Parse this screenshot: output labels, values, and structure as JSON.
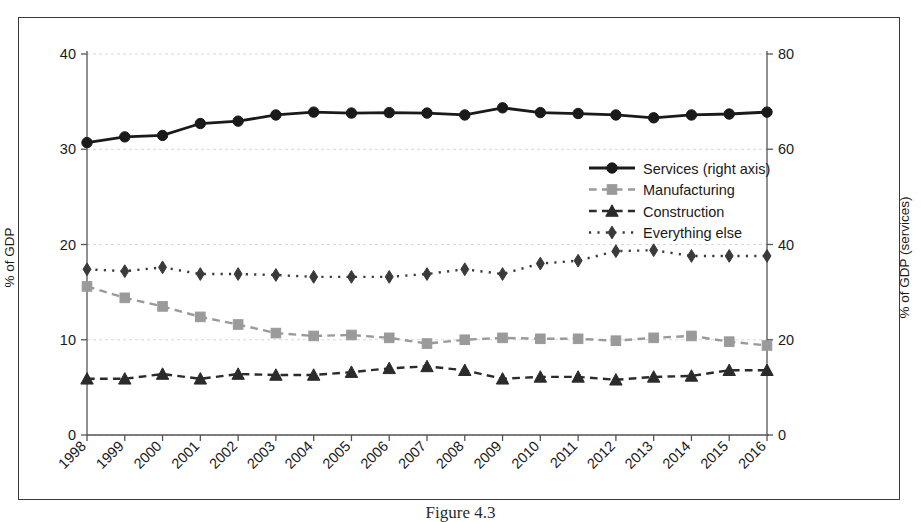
{
  "chart_data": {
    "type": "line",
    "title": "",
    "xlabel": "",
    "ylabel": "% of GDP",
    "ylabel_right": "% of GDP (services)",
    "ylim": [
      0,
      40
    ],
    "ylim_right": [
      0,
      80
    ],
    "yticks": [
      "0",
      "10",
      "20",
      "30",
      "40"
    ],
    "yticks_right": [
      "0",
      "20",
      "40",
      "60",
      "80"
    ],
    "grid": true,
    "legend_position": "center-right-upper",
    "categories": [
      "1998",
      "1999",
      "2000",
      "2001",
      "2002",
      "2003",
      "2004",
      "2005",
      "2006",
      "2007",
      "2008",
      "2009",
      "2010",
      "2011",
      "2012",
      "2013",
      "2014",
      "2015",
      "2016"
    ],
    "series": [
      {
        "name": "Services (right axis)",
        "axis": "right",
        "marker": "circle",
        "linestyle": "solid",
        "color": "#1a1a1a",
        "values": [
          61.4,
          62.6,
          62.9,
          65.4,
          65.9,
          67.2,
          67.8,
          67.6,
          67.7,
          67.6,
          67.2,
          68.7,
          67.7,
          67.5,
          67.2,
          66.6,
          67.2,
          67.4,
          67.8
        ]
      },
      {
        "name": "Manufacturing",
        "axis": "left",
        "marker": "square",
        "linestyle": "dashed",
        "color": "#9a9a9a",
        "values": [
          15.6,
          14.4,
          13.5,
          12.4,
          11.6,
          10.7,
          10.4,
          10.5,
          10.2,
          9.6,
          10.0,
          10.2,
          10.1,
          10.1,
          9.9,
          10.2,
          10.4,
          9.8,
          9.4
        ]
      },
      {
        "name": "Construction",
        "axis": "left",
        "marker": "triangle",
        "linestyle": "dashed",
        "color": "#2b2b2b",
        "values": [
          5.9,
          5.9,
          6.4,
          5.9,
          6.4,
          6.3,
          6.3,
          6.6,
          7.0,
          7.2,
          6.8,
          5.9,
          6.1,
          6.1,
          5.8,
          6.1,
          6.2,
          6.8,
          6.8
        ]
      },
      {
        "name": "Everything else",
        "axis": "left",
        "marker": "diamond",
        "linestyle": "dotted",
        "color": "#3a3a3a",
        "values": [
          17.4,
          17.2,
          17.6,
          16.9,
          16.9,
          16.8,
          16.6,
          16.6,
          16.6,
          16.9,
          17.4,
          16.9,
          18.0,
          18.3,
          19.3,
          19.4,
          18.8,
          18.8,
          18.8
        ]
      }
    ]
  },
  "caption": "Figure 4.3",
  "colors": {
    "frame": "#3a3a3a",
    "axis": "#555555",
    "grid": "#d8d8d8",
    "background": "#ffffff"
  }
}
